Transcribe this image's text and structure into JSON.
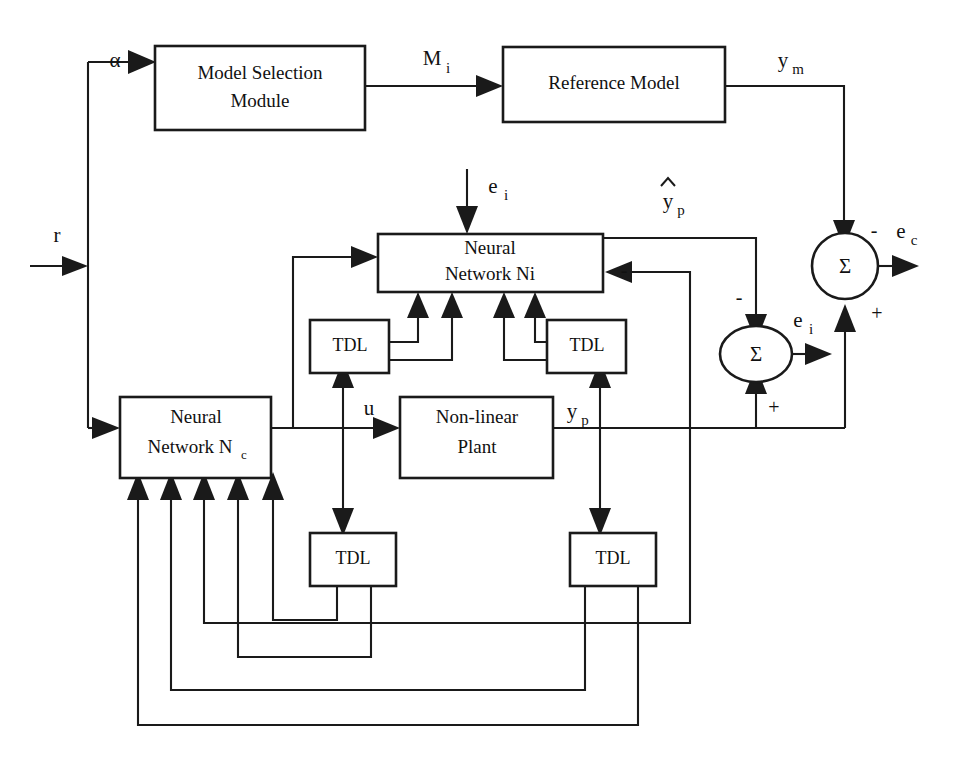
{
  "diagram": {
    "stroke_color": "#1a1a1a",
    "background_color": "#ffffff",
    "blocks": [
      {
        "id": "model-selection-module",
        "line1": "Model Selection",
        "line2": "Module"
      },
      {
        "id": "reference-model",
        "line1": "Reference Model",
        "line2": ""
      },
      {
        "id": "neural-network-ni",
        "line1": "Neural",
        "line2": "Network Ni"
      },
      {
        "id": "neural-network-nc",
        "line1": "Neural",
        "line2": "Network N",
        "sub": "c"
      },
      {
        "id": "non-linear-plant",
        "line1": "Non-linear",
        "line2": "Plant"
      },
      {
        "id": "tdl-upper-left",
        "line1": "TDL",
        "line2": ""
      },
      {
        "id": "tdl-upper-right",
        "line1": "TDL",
        "line2": ""
      },
      {
        "id": "tdl-lower-left",
        "line1": "TDL",
        "line2": ""
      },
      {
        "id": "tdl-lower-right",
        "line1": "TDL",
        "line2": ""
      }
    ],
    "summing_junctions": [
      {
        "id": "sum-ec",
        "symbol": "Σ",
        "output_label": "e",
        "output_sub": "c",
        "shape": "circle"
      },
      {
        "id": "sum-ei",
        "symbol": "Σ",
        "output_label": "e",
        "output_sub": "i",
        "shape": "ellipse"
      }
    ],
    "signals": {
      "alpha": "α",
      "r": "r",
      "mi_base": "M",
      "mi_sub": "i",
      "ym_base": "y",
      "ym_sub": "m",
      "ei_base": "e",
      "ei_sub": "i",
      "ec_base": "e",
      "ec_sub": "c",
      "yp_hat_base": "y",
      "yp_hat_sub": "p",
      "yp_base": "y",
      "yp_sub": "p",
      "u": "u"
    },
    "signs": {
      "minus_ec_input": "-",
      "plus_ec_input": "+",
      "minus_ei_input": "-",
      "plus_ei_input": "+",
      "minus_ec_output": "-"
    }
  }
}
